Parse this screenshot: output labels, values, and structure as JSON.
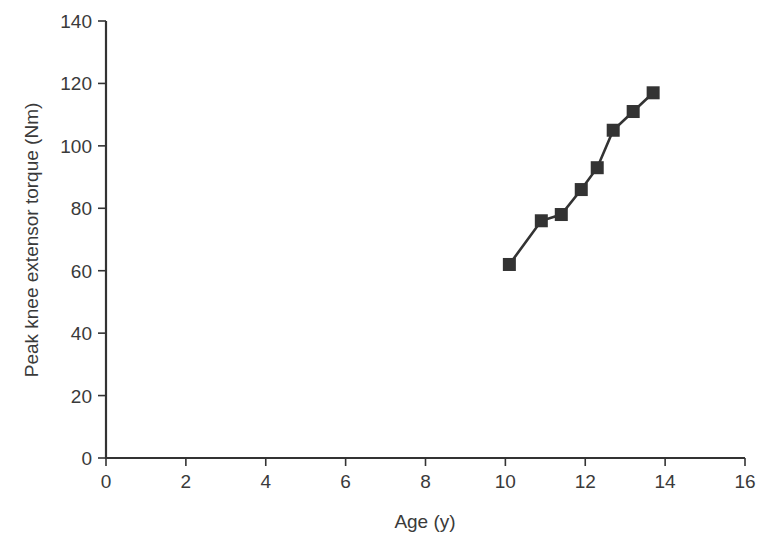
{
  "chart_data": {
    "type": "line",
    "title": "",
    "xlabel": "Age (y)",
    "ylabel": "Peak knee extensor torque (Nm)",
    "xlim": [
      0,
      16
    ],
    "ylim": [
      0,
      140
    ],
    "xticks": [
      0,
      2,
      4,
      6,
      8,
      10,
      12,
      14,
      16
    ],
    "yticks": [
      0,
      20,
      40,
      60,
      80,
      100,
      120,
      140
    ],
    "grid": false,
    "legend": null,
    "marker": "square",
    "series": [
      {
        "name": "Peak knee extensor torque",
        "color": "#333333",
        "x": [
          10.1,
          10.9,
          11.4,
          11.9,
          12.3,
          12.7,
          13.2,
          13.7
        ],
        "y": [
          62,
          76,
          78,
          86,
          93,
          105,
          111,
          117
        ]
      }
    ]
  }
}
